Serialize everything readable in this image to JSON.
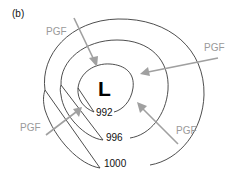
{
  "figure": {
    "panel_label": "(b)",
    "center": {
      "label": "L",
      "meaning": "low-pressure center"
    },
    "isobars": [
      {
        "value": "992",
        "label": "992"
      },
      {
        "value": "996",
        "label": "996"
      },
      {
        "value": "1000",
        "label": "1000"
      }
    ],
    "arrows": [
      {
        "label": "PGF",
        "position": "top-left"
      },
      {
        "label": "PGF",
        "position": "right"
      },
      {
        "label": "PGF",
        "position": "left"
      },
      {
        "label": "PGF",
        "position": "bottom-right"
      }
    ],
    "colors": {
      "isobar": "#3a3a3a",
      "arrow": "#a0a0a0",
      "pgf_text": "#9a9a9a",
      "text": "#111111"
    }
  }
}
